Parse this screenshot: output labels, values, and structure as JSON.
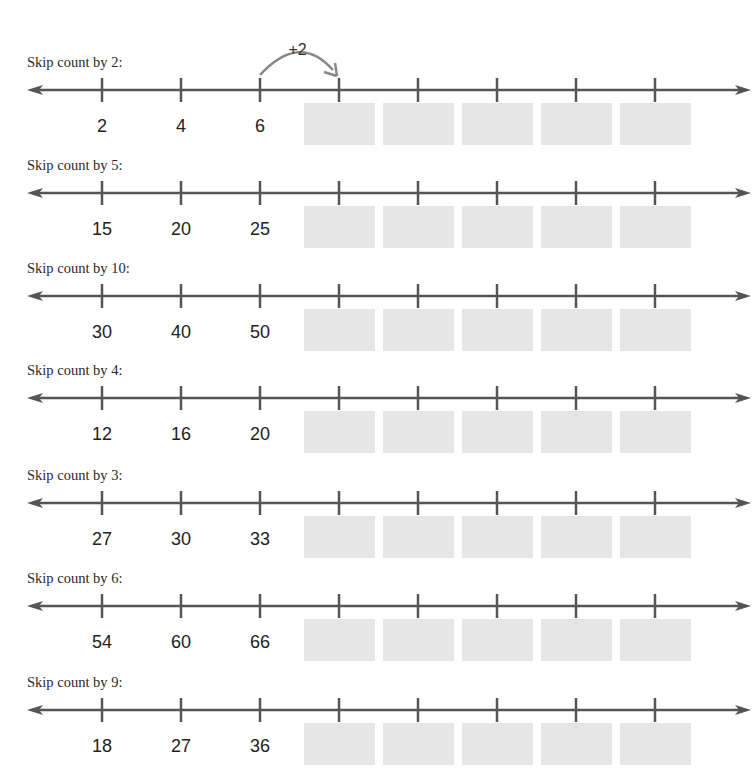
{
  "worksheet": {
    "example_hop": {
      "label": "+2",
      "from_tick": 2,
      "to_tick": 3
    },
    "layout": {
      "tick_x": [
        102,
        181,
        260,
        339,
        418,
        497,
        576,
        655
      ],
      "answer_box_count": 5,
      "colors": {
        "line": "#555555",
        "answer_box": "#e6e6e6",
        "hop_arrow": "#888888"
      }
    },
    "rows": [
      {
        "label": "Skip count by 2:",
        "step": 2,
        "given": [
          "2",
          "4",
          "6"
        ]
      },
      {
        "label": "Skip count by 5:",
        "step": 5,
        "given": [
          "15",
          "20",
          "25"
        ]
      },
      {
        "label": "Skip count by 10:",
        "step": 10,
        "given": [
          "30",
          "40",
          "50"
        ]
      },
      {
        "label": "Skip count by 4:",
        "step": 4,
        "given": [
          "12",
          "16",
          "20"
        ]
      },
      {
        "label": "Skip count by 3:",
        "step": 3,
        "given": [
          "27",
          "30",
          "33"
        ]
      },
      {
        "label": "Skip count by 6:",
        "step": 6,
        "given": [
          "54",
          "60",
          "66"
        ]
      },
      {
        "label": "Skip count by 9:",
        "step": 9,
        "given": [
          "18",
          "27",
          "36"
        ]
      }
    ]
  }
}
